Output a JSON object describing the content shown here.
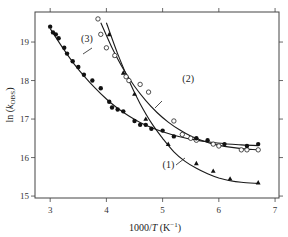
{
  "chart_data": {
    "type": "scatter",
    "title": "",
    "xlabel": "1000/T (K⁻¹)",
    "ylabel": "ln (k_OBS)",
    "xlim": [
      2.73,
      7.07
    ],
    "ylim": [
      14.95,
      19.78
    ],
    "xticks": [
      3,
      4,
      5,
      6,
      7
    ],
    "yticks": [
      15,
      16,
      17,
      18,
      19
    ],
    "grid": false,
    "legend": "none (curves labelled inline)",
    "series": [
      {
        "name": "(1)",
        "marker": "filled-triangle",
        "points": [
          [
            4.05,
            19.2
          ],
          [
            4.15,
            18.65
          ],
          [
            4.3,
            18.2
          ],
          [
            4.5,
            17.65
          ],
          [
            4.7,
            17.0
          ],
          [
            5.1,
            16.35
          ],
          [
            5.6,
            15.85
          ],
          [
            5.9,
            15.65
          ],
          [
            6.2,
            15.45
          ],
          [
            6.7,
            15.35
          ]
        ],
        "fit": [
          [
            4.0,
            19.5
          ],
          [
            4.2,
            18.7
          ],
          [
            4.4,
            18.0
          ],
          [
            4.6,
            17.4
          ],
          [
            4.8,
            16.9
          ],
          [
            5.0,
            16.5
          ],
          [
            5.2,
            16.15
          ],
          [
            5.4,
            15.9
          ],
          [
            5.6,
            15.72
          ],
          [
            5.8,
            15.58
          ],
          [
            6.0,
            15.47
          ],
          [
            6.2,
            15.4
          ],
          [
            6.4,
            15.36
          ],
          [
            6.7,
            15.33
          ]
        ],
        "label_pos": [
          5.0,
          15.72
        ]
      },
      {
        "name": "(2)",
        "marker": "open-circle",
        "points": [
          [
            3.85,
            19.6
          ],
          [
            3.9,
            19.2
          ],
          [
            4.0,
            18.85
          ],
          [
            4.15,
            18.65
          ],
          [
            4.35,
            18.1
          ],
          [
            4.4,
            18.0
          ],
          [
            4.6,
            17.9
          ],
          [
            4.75,
            17.7
          ],
          [
            5.2,
            16.95
          ],
          [
            5.35,
            16.6
          ],
          [
            5.5,
            16.5
          ],
          [
            5.6,
            16.45
          ],
          [
            5.9,
            16.35
          ],
          [
            6.0,
            16.3
          ],
          [
            6.4,
            16.2
          ],
          [
            6.5,
            16.2
          ],
          [
            6.7,
            16.2
          ]
        ],
        "fit": [
          [
            3.9,
            19.5
          ],
          [
            4.1,
            18.85
          ],
          [
            4.3,
            18.3
          ],
          [
            4.5,
            17.85
          ],
          [
            4.7,
            17.48
          ],
          [
            4.9,
            17.17
          ],
          [
            5.1,
            16.92
          ],
          [
            5.3,
            16.72
          ],
          [
            5.5,
            16.56
          ],
          [
            5.7,
            16.44
          ],
          [
            5.9,
            16.35
          ],
          [
            6.1,
            16.29
          ],
          [
            6.3,
            16.25
          ],
          [
            6.5,
            16.22
          ],
          [
            6.7,
            16.2
          ]
        ],
        "label_pos": [
          5.35,
          17.95
        ]
      },
      {
        "name": "(3)",
        "marker": "filled-circle",
        "points": [
          [
            3.0,
            19.4
          ],
          [
            3.05,
            19.25
          ],
          [
            3.1,
            19.2
          ],
          [
            3.15,
            19.1
          ],
          [
            3.25,
            18.85
          ],
          [
            3.3,
            18.7
          ],
          [
            3.4,
            18.5
          ],
          [
            3.5,
            18.35
          ],
          [
            3.6,
            18.15
          ],
          [
            3.75,
            18.0
          ],
          [
            3.9,
            17.8
          ],
          [
            4.05,
            17.45
          ],
          [
            4.1,
            17.3
          ],
          [
            4.2,
            17.25
          ],
          [
            4.3,
            17.2
          ],
          [
            4.5,
            16.95
          ],
          [
            4.6,
            16.85
          ],
          [
            4.7,
            16.85
          ],
          [
            4.8,
            16.75
          ],
          [
            5.0,
            16.7
          ],
          [
            5.2,
            16.55
          ],
          [
            5.6,
            16.5
          ],
          [
            5.8,
            16.45
          ],
          [
            6.1,
            16.35
          ],
          [
            6.5,
            16.3
          ],
          [
            6.7,
            16.35
          ]
        ],
        "fit": [
          [
            3.0,
            19.35
          ],
          [
            3.2,
            18.9
          ],
          [
            3.4,
            18.48
          ],
          [
            3.6,
            18.12
          ],
          [
            3.8,
            17.8
          ],
          [
            4.0,
            17.52
          ],
          [
            4.2,
            17.28
          ],
          [
            4.4,
            17.08
          ],
          [
            4.6,
            16.91
          ],
          [
            4.8,
            16.78
          ],
          [
            5.0,
            16.67
          ],
          [
            5.2,
            16.58
          ],
          [
            5.5,
            16.48
          ],
          [
            5.8,
            16.41
          ],
          [
            6.1,
            16.36
          ],
          [
            6.4,
            16.33
          ],
          [
            6.7,
            16.31
          ]
        ],
        "label_pos": [
          3.55,
          19.0
        ]
      }
    ]
  },
  "axes": {
    "x_title_main": "1000/",
    "x_title_italic": "T",
    "x_title_unit": " (K",
    "x_title_sup": "−1",
    "x_title_close": ")",
    "y_title_main": "ln (",
    "y_title_italic": "k",
    "y_title_sub": "OBS",
    "y_title_close": ")"
  }
}
